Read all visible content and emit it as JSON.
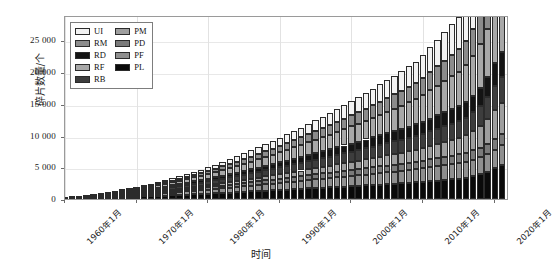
{
  "chart_data": {
    "type": "bar",
    "stacked": true,
    "title": "",
    "xlabel": "时间",
    "ylabel": "碎片数量/个",
    "ylim": [
      0,
      29000
    ],
    "yticks": [
      0,
      5000,
      10000,
      15000,
      20000,
      25000
    ],
    "ytick_labels": [
      "0",
      "5 000",
      "10 000",
      "15 000",
      "20 000",
      "25 000"
    ],
    "xtick_labels": [
      "1960年1月",
      "1970年1月",
      "1980年1月",
      "1990年1月",
      "2000年1月",
      "2010年1月",
      "2020年1月"
    ],
    "xlim": [
      1960,
      2022
    ],
    "grid": "both-faint",
    "legend_position": "top-left-inside",
    "legend_entries": [
      {
        "label": "UI",
        "color": "#f2f2f2"
      },
      {
        "label": "RM",
        "color": "#8c8c8c"
      },
      {
        "label": "RD",
        "color": "#141414"
      },
      {
        "label": "RF",
        "color": "#a8a8a8"
      },
      {
        "label": "RB",
        "color": "#3d3d3d"
      },
      {
        "label": "PM",
        "color": "#9e9e9e"
      },
      {
        "label": "PD",
        "color": "#7a7a7a"
      },
      {
        "label": "PF",
        "color": "#8f8f8f"
      },
      {
        "label": "PL",
        "color": "#0a0a0a"
      }
    ],
    "series_order_bottom_to_top": [
      "PL",
      "PF",
      "PD",
      "PM",
      "RB",
      "RD",
      "RF",
      "RM",
      "UI"
    ],
    "categories": [
      1960,
      1961,
      1962,
      1963,
      1964,
      1965,
      1966,
      1967,
      1968,
      1969,
      1970,
      1971,
      1972,
      1973,
      1974,
      1975,
      1976,
      1977,
      1978,
      1979,
      1980,
      1981,
      1982,
      1983,
      1984,
      1985,
      1986,
      1987,
      1988,
      1989,
      1990,
      1991,
      1992,
      1993,
      1994,
      1995,
      1996,
      1997,
      1998,
      1999,
      2000,
      2001,
      2002,
      2003,
      2004,
      2005,
      2006,
      2007,
      2008,
      2009,
      2010,
      2011,
      2012,
      2013,
      2014,
      2015,
      2016,
      2017,
      2018,
      2019,
      2020,
      2021
    ],
    "series": [
      {
        "name": "PL",
        "values": [
          20,
          40,
          70,
          110,
          150,
          190,
          230,
          270,
          310,
          350,
          390,
          430,
          470,
          510,
          550,
          590,
          640,
          690,
          740,
          790,
          840,
          890,
          950,
          1010,
          1070,
          1130,
          1190,
          1250,
          1310,
          1370,
          1430,
          1490,
          1550,
          1610,
          1670,
          1730,
          1790,
          1850,
          1910,
          1970,
          2030,
          2090,
          2150,
          2210,
          2270,
          2330,
          2400,
          2470,
          2540,
          2610,
          2700,
          2800,
          2900,
          3000,
          3100,
          3200,
          3350,
          3600,
          3900,
          4300,
          4900,
          5400
        ]
      },
      {
        "name": "PF",
        "values": [
          10,
          20,
          35,
          55,
          80,
          105,
          130,
          160,
          190,
          220,
          250,
          285,
          320,
          355,
          390,
          430,
          470,
          510,
          550,
          590,
          630,
          675,
          720,
          765,
          810,
          860,
          910,
          960,
          1010,
          1060,
          1110,
          1160,
          1210,
          1260,
          1310,
          1360,
          1410,
          1460,
          1510,
          1560,
          1610,
          1660,
          1710,
          1760,
          1810,
          1860,
          1910,
          1960,
          2010,
          2060,
          2120,
          2180,
          2240,
          2300,
          2360,
          2420,
          2490,
          2570,
          2660,
          2760,
          2900,
          3050
        ]
      },
      {
        "name": "PD",
        "values": [
          5,
          12,
          22,
          35,
          50,
          68,
          86,
          105,
          125,
          145,
          165,
          186,
          208,
          230,
          252,
          275,
          298,
          322,
          346,
          370,
          394,
          419,
          444,
          470,
          496,
          522,
          548,
          575,
          602,
          629,
          656,
          684,
          712,
          740,
          768,
          796,
          824,
          852,
          880,
          908,
          936,
          964,
          992,
          1020,
          1048,
          1076,
          1105,
          1134,
          1163,
          1192,
          1225,
          1260,
          1295,
          1330,
          1365,
          1400,
          1440,
          1490,
          1550,
          1620,
          1720,
          1820
        ]
      },
      {
        "name": "RB",
        "values": [
          8,
          18,
          30,
          46,
          66,
          88,
          112,
          138,
          166,
          195,
          225,
          256,
          288,
          321,
          355,
          390,
          426,
          463,
          501,
          540,
          580,
          621,
          663,
          706,
          750,
          795,
          841,
          888,
          936,
          985,
          1035,
          1086,
          1138,
          1191,
          1245,
          1300,
          1356,
          1413,
          1471,
          1530,
          1590,
          1651,
          1713,
          1776,
          1840,
          1905,
          1971,
          2038,
          2106,
          2175,
          2250,
          2330,
          2410,
          2490,
          2570,
          2650,
          2760,
          2920,
          3140,
          3420,
          3800,
          4100
        ]
      },
      {
        "name": "RD",
        "values": [
          4,
          9,
          16,
          25,
          36,
          49,
          64,
          81,
          100,
          121,
          144,
          168,
          193,
          219,
          246,
          274,
          303,
          333,
          364,
          396,
          429,
          463,
          498,
          534,
          571,
          609,
          648,
          688,
          729,
          771,
          814,
          858,
          903,
          949,
          996,
          1044,
          1093,
          1143,
          1194,
          1246,
          1299,
          1353,
          1408,
          1464,
          1521,
          1579,
          1638,
          1698,
          1759,
          1821,
          1900,
          1990,
          2080,
          2170,
          2260,
          2350,
          2470,
          2640,
          2870,
          3180,
          3600,
          3900
        ]
      },
      {
        "name": "RF",
        "values": [
          6,
          14,
          25,
          40,
          58,
          79,
          103,
          130,
          160,
          193,
          229,
          268,
          310,
          355,
          403,
          454,
          508,
          565,
          625,
          688,
          754,
          823,
          895,
          970,
          1048,
          1129,
          1213,
          1300,
          1390,
          1483,
          1579,
          1678,
          1780,
          1885,
          1993,
          2104,
          2218,
          2335,
          2455,
          2578,
          2704,
          2833,
          2965,
          3100,
          3238,
          3379,
          3523,
          3670,
          3820,
          3973,
          4200,
          4450,
          4700,
          4950,
          5200,
          5450,
          5800,
          6300,
          6900,
          7600,
          8600,
          9400
        ]
      },
      {
        "name": "RM",
        "values": [
          3,
          7,
          13,
          21,
          31,
          43,
          57,
          73,
          91,
          111,
          133,
          157,
          183,
          211,
          241,
          273,
          307,
          343,
          381,
          421,
          463,
          507,
          553,
          601,
          651,
          703,
          757,
          813,
          871,
          931,
          993,
          1057,
          1123,
          1191,
          1261,
          1333,
          1407,
          1483,
          1561,
          1641,
          1723,
          1807,
          1893,
          1981,
          2071,
          2163,
          2257,
          2353,
          2451,
          2551,
          2700,
          2870,
          3040,
          3210,
          3380,
          3550,
          3800,
          4200,
          4700,
          5350,
          6200,
          6800
        ]
      },
      {
        "name": "PM",
        "values": [
          2,
          5,
          9,
          15,
          22,
          31,
          41,
          53,
          66,
          81,
          97,
          115,
          134,
          155,
          177,
          201,
          226,
          253,
          281,
          311,
          342,
          375,
          409,
          445,
          482,
          521,
          561,
          603,
          646,
          691,
          737,
          785,
          834,
          885,
          937,
          991,
          1046,
          1103,
          1161,
          1221,
          1282,
          1345,
          1409,
          1475,
          1542,
          1611,
          1681,
          1753,
          1826,
          1901,
          2000,
          2120,
          2240,
          2360,
          2480,
          2600,
          2780,
          3060,
          3440,
          3920,
          4500,
          4900
        ]
      },
      {
        "name": "UI",
        "values": [
          3,
          8,
          15,
          25,
          38,
          53,
          71,
          92,
          115,
          141,
          169,
          200,
          234,
          270,
          309,
          351,
          395,
          442,
          492,
          544,
          599,
          657,
          717,
          780,
          846,
          914,
          985,
          1059,
          1135,
          1214,
          1296,
          1380,
          1467,
          1557,
          1649,
          1744,
          1842,
          1942,
          2045,
          2151,
          2259,
          2370,
          2484,
          2600,
          2719,
          2841,
          2965,
          3092,
          3222,
          3354,
          3600,
          3900,
          4200,
          4500,
          4800,
          5100,
          5500,
          6100,
          6900,
          7900,
          9200,
          10100
        ]
      }
    ]
  },
  "axis": {
    "y_title": "碎片数量/个",
    "x_title": "时间"
  }
}
